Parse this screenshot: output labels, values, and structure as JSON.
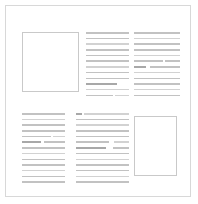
{
  "document": {
    "title": "Wireframe Page Layout",
    "background_color": "#ffffff",
    "border_color": "#d8d8d8",
    "page": {
      "x": 5,
      "y": 5,
      "width": 186,
      "height": 192
    }
  },
  "palette": {
    "page_background": "#ffffff",
    "page_border": "#d8d8d8",
    "placeholder_border": "#c9c9c9",
    "text_line_default": "#c2c2c2",
    "text_line_dark": "#a8a8a8",
    "text_line_light": "#d2d2d2"
  },
  "regions": [
    {
      "name": "top-left-image-placeholder",
      "kind": "image-placeholder",
      "x": 16,
      "y": 26,
      "width": 57,
      "height": 60,
      "label": ""
    },
    {
      "name": "top-middle-text-column",
      "kind": "text-block",
      "x": 80,
      "y": 26,
      "width": 43,
      "lines": [
        {
          "width_pct": 100,
          "tone": "default"
        },
        {
          "width_pct": 100,
          "tone": "default"
        },
        {
          "width_pct": 100,
          "tone": "light"
        },
        {
          "width_pct": 100,
          "tone": "default"
        },
        {
          "width_pct": 100,
          "tone": "default"
        },
        {
          "width_pct": 100,
          "tone": "default"
        },
        {
          "width_pct": 100,
          "tone": "light"
        },
        {
          "width_pct": 100,
          "tone": "default"
        },
        {
          "width_pct": 100,
          "tone": "default"
        },
        {
          "width_pct": 72,
          "tone": "dark"
        },
        {
          "width_pct": 100,
          "tone": "light"
        },
        {
          "segments": [
            {
              "width_pct": 62,
              "tone": "default"
            },
            {
              "gap_pct": 6
            },
            {
              "width_pct": 32,
              "tone": "light"
            }
          ]
        }
      ]
    },
    {
      "name": "top-right-text-column",
      "kind": "text-block",
      "x": 128,
      "y": 26,
      "width": 46,
      "lines": [
        {
          "width_pct": 100,
          "tone": "default"
        },
        {
          "width_pct": 100,
          "tone": "light"
        },
        {
          "width_pct": 100,
          "tone": "default"
        },
        {
          "width_pct": 100,
          "tone": "default"
        },
        {
          "width_pct": 100,
          "tone": "light"
        },
        {
          "segments": [
            {
              "width_pct": 63,
              "tone": "default"
            },
            {
              "gap_pct": 5
            },
            {
              "width_pct": 32,
              "tone": "default"
            }
          ]
        },
        {
          "segments": [
            {
              "width_pct": 27,
              "tone": "dark"
            },
            {
              "gap_pct": 7
            },
            {
              "width_pct": 66,
              "tone": "default"
            }
          ]
        },
        {
          "width_pct": 100,
          "tone": "light"
        },
        {
          "width_pct": 100,
          "tone": "default"
        },
        {
          "width_pct": 100,
          "tone": "default"
        },
        {
          "width_pct": 100,
          "tone": "light"
        },
        {
          "width_pct": 100,
          "tone": "default"
        }
      ]
    },
    {
      "name": "bottom-left-text-column",
      "kind": "text-block",
      "x": 16,
      "y": 107,
      "width": 43,
      "lines": [
        {
          "width_pct": 100,
          "tone": "default"
        },
        {
          "width_pct": 100,
          "tone": "light"
        },
        {
          "width_pct": 100,
          "tone": "default"
        },
        {
          "width_pct": 100,
          "tone": "default"
        },
        {
          "segments": [
            {
              "width_pct": 67,
              "tone": "default"
            },
            {
              "gap_pct": 6
            },
            {
              "width_pct": 27,
              "tone": "light"
            }
          ]
        },
        {
          "segments": [
            {
              "width_pct": 44,
              "tone": "dark"
            },
            {
              "gap_pct": 8
            },
            {
              "width_pct": 48,
              "tone": "default"
            }
          ]
        },
        {
          "width_pct": 100,
          "tone": "default"
        },
        {
          "width_pct": 100,
          "tone": "light"
        },
        {
          "width_pct": 100,
          "tone": "default"
        },
        {
          "width_pct": 100,
          "tone": "default"
        },
        {
          "width_pct": 100,
          "tone": "light"
        },
        {
          "width_pct": 100,
          "tone": "default"
        },
        {
          "width_pct": 100,
          "tone": "default"
        }
      ]
    },
    {
      "name": "bottom-middle-text-column",
      "kind": "text-block",
      "x": 70,
      "y": 107,
      "width": 53,
      "lines": [
        {
          "segments": [
            {
              "width_pct": 12,
              "tone": "dark"
            },
            {
              "gap_pct": 4
            },
            {
              "width_pct": 84,
              "tone": "light"
            }
          ]
        },
        {
          "width_pct": 100,
          "tone": "default"
        },
        {
          "width_pct": 100,
          "tone": "light"
        },
        {
          "width_pct": 100,
          "tone": "default"
        },
        {
          "width_pct": 100,
          "tone": "default"
        },
        {
          "segments": [
            {
              "width_pct": 62,
              "tone": "default"
            },
            {
              "gap_pct": 10
            },
            {
              "width_pct": 28,
              "tone": "light"
            }
          ]
        },
        {
          "segments": [
            {
              "width_pct": 57,
              "tone": "dark"
            },
            {
              "gap_pct": 13
            },
            {
              "width_pct": 30,
              "tone": "default"
            }
          ]
        },
        {
          "width_pct": 100,
          "tone": "default"
        },
        {
          "width_pct": 100,
          "tone": "light"
        },
        {
          "width_pct": 100,
          "tone": "default"
        },
        {
          "width_pct": 100,
          "tone": "default"
        },
        {
          "width_pct": 100,
          "tone": "light"
        },
        {
          "width_pct": 100,
          "tone": "default"
        }
      ]
    },
    {
      "name": "bottom-right-image-placeholder",
      "kind": "image-placeholder",
      "x": 128,
      "y": 110,
      "width": 43,
      "height": 60,
      "label": ""
    }
  ]
}
